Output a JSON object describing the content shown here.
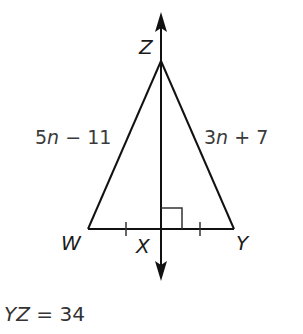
{
  "diagram": {
    "type": "isosceles-triangle-perpendicular-bisector",
    "vertices": {
      "Z": {
        "label": "Z",
        "x": 161,
        "y": 61
      },
      "W": {
        "label": "W",
        "x": 88,
        "y": 229
      },
      "Y": {
        "label": "Y",
        "x": 234,
        "y": 229
      },
      "X": {
        "label": "X",
        "x": 161,
        "y": 229
      }
    },
    "side_labels": {
      "WZ": {
        "coef": "5",
        "var": "n",
        "op": " − ",
        "const": "11"
      },
      "YZ": {
        "coef": "3",
        "var": "n",
        "op": " + ",
        "const": "7"
      }
    },
    "markings": {
      "right_angle_at": "X",
      "congruent_ticks": [
        "WX",
        "XY"
      ],
      "perpendicular_line": "ZX (double-headed arrow)"
    },
    "given": {
      "var": "YZ",
      "equals": " = ",
      "value": "34"
    },
    "colors": {
      "stroke": "#111111",
      "text": "#333333",
      "background": "#ffffff"
    }
  }
}
